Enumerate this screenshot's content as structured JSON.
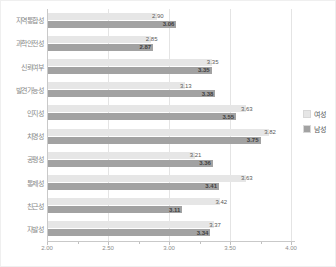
{
  "chart_data": {
    "type": "bar",
    "orientation": "horizontal",
    "title": "",
    "categories": [
      "지역통합성",
      "과학안전성",
      "신뢰여부",
      "발견가능성",
      "인지성",
      "치명성",
      "공평성",
      "통제성",
      "친근성",
      "자발성"
    ],
    "series": [
      {
        "name": "여성",
        "color": "#e6e6e6",
        "label_style": "normal",
        "values": [
          2.9,
          2.85,
          3.35,
          3.13,
          3.63,
          3.82,
          3.21,
          3.63,
          3.42,
          3.37
        ]
      },
      {
        "name": "남성",
        "color": "#a2a2a2",
        "label_style": "bold",
        "values": [
          3.06,
          2.87,
          3.35,
          3.38,
          3.55,
          3.75,
          3.36,
          3.41,
          3.11,
          3.34
        ]
      }
    ],
    "xlim": [
      2.0,
      4.0
    ],
    "xticks": [
      2.0,
      2.5,
      3.0,
      3.5,
      4.0
    ],
    "minor_xticks": [
      2.25,
      2.75,
      3.25,
      3.75
    ],
    "xtick_labels": [
      "2.00",
      "2.50",
      "3.00",
      "3.50",
      "4.00"
    ],
    "grid": true,
    "legend_position": "right",
    "value_label_decimals": 2
  },
  "colors": {
    "gridline": "#e4e4e4",
    "axis": "#c9c9c9",
    "category_text": "#8a8a8a",
    "value_text": "#5a5a5a",
    "value_text_bold": "#404040",
    "background": "#ffffff"
  }
}
